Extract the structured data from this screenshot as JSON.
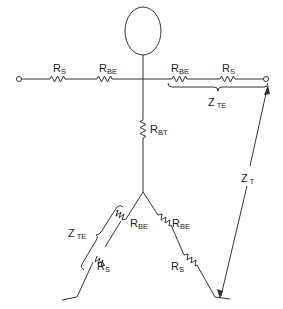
{
  "diagram": {
    "labels": {
      "left_arm_rs": {
        "main": "R",
        "sub": "S"
      },
      "left_arm_rbe": {
        "main": "R",
        "sub": "BE"
      },
      "right_arm_rbe": {
        "main": "R",
        "sub": "BE"
      },
      "right_arm_rs": {
        "main": "R",
        "sub": "S"
      },
      "right_arm_zte": {
        "main": "Z",
        "sub": "TE"
      },
      "trunk_rbt": {
        "main": "R",
        "sub": "BT"
      },
      "left_leg_zte": {
        "main": "Z",
        "sub": "TE"
      },
      "left_leg_rbe": {
        "main": "R",
        "sub": "BE"
      },
      "left_leg_rs": {
        "main": "R",
        "sub": "S"
      },
      "right_leg_rbe": {
        "main": "R",
        "sub": "BE"
      },
      "right_leg_rs": {
        "main": "R",
        "sub": "S"
      },
      "total_zt": {
        "main": "Z",
        "sub": "T"
      }
    },
    "stroke_color": "#333333"
  }
}
